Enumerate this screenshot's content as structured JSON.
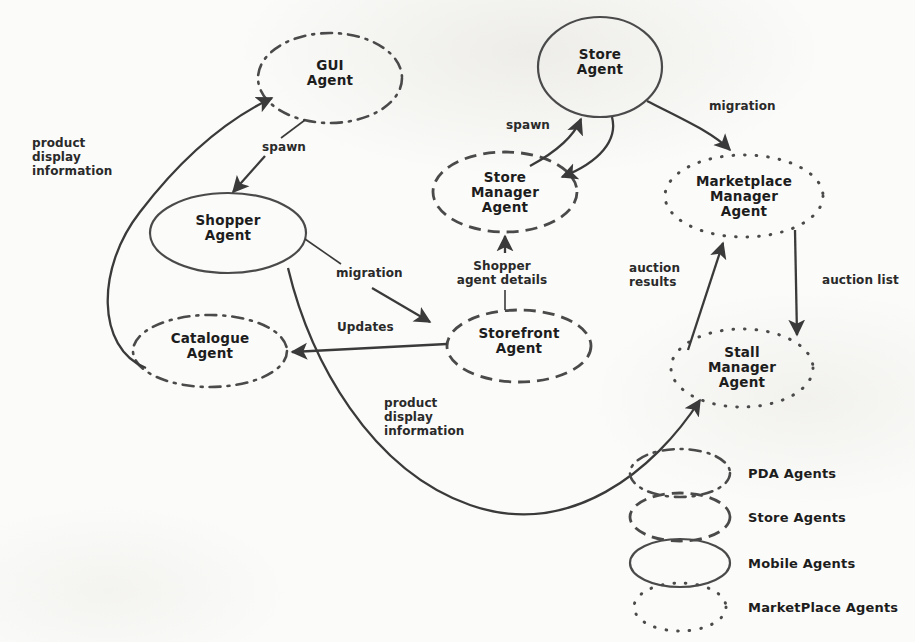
{
  "diagram": {
    "stroke_color": "#3a3a3a",
    "text_color": "#1d1d1d",
    "background_color": "#fbfbf9"
  },
  "nodes": [
    {
      "id": "gui-agent",
      "label": "GUI\nAgent",
      "style": "pda",
      "cx": 330,
      "cy": 78,
      "rx": 72,
      "ry": 45
    },
    {
      "id": "store-agent",
      "label": "Store\nAgent",
      "style": "mobile",
      "cx": 600,
      "cy": 67,
      "rx": 62,
      "ry": 50
    },
    {
      "id": "store-manager-agent",
      "label": "Store\nManager\nAgent",
      "style": "store",
      "cx": 505,
      "cy": 192,
      "rx": 72,
      "ry": 40
    },
    {
      "id": "marketplace-manager-agent",
      "label": "Marketplace\nManager\nAgent",
      "style": "marketplace",
      "cx": 744,
      "cy": 196,
      "rx": 79,
      "ry": 41
    },
    {
      "id": "shopper-agent",
      "label": "Shopper\nAgent",
      "style": "mobile",
      "cx": 228,
      "cy": 233,
      "rx": 78,
      "ry": 40
    },
    {
      "id": "catalogue-agent",
      "label": "Catalogue\nAgent",
      "style": "pda",
      "cx": 210,
      "cy": 351,
      "rx": 77,
      "ry": 36
    },
    {
      "id": "storefront-agent",
      "label": "Storefront\nAgent",
      "style": "store",
      "cx": 519,
      "cy": 346,
      "rx": 72,
      "ry": 36
    },
    {
      "id": "stall-manager-agent",
      "label": "Stall\nManager\nAgent",
      "style": "marketplace",
      "cx": 742,
      "cy": 368,
      "rx": 71,
      "ry": 39
    }
  ],
  "edges": [
    {
      "id": "gui-spawns-shopper",
      "label": "spawn",
      "from": "gui-agent",
      "to": "shopper-agent",
      "lx": 262,
      "ly": 140
    },
    {
      "id": "store-spawns-store-manager",
      "label": "spawn",
      "from": "store-agent",
      "to": "store-manager-agent",
      "lx": 506,
      "ly": 118
    },
    {
      "id": "store-migration-marketplace",
      "label": "migration",
      "from": "store-agent",
      "to": "marketplace-manager-agent",
      "lx": 709,
      "ly": 99
    },
    {
      "id": "shopper-migration-storefront",
      "label": "migration",
      "from": "shopper-agent",
      "to": "storefront-agent",
      "lx": 336,
      "ly": 266
    },
    {
      "id": "storefront-shopper-agent-details",
      "label": "Shopper\nagent details",
      "from": "storefront-agent",
      "to": "store-manager-agent",
      "lx": 474,
      "ly": 259
    },
    {
      "id": "storefront-updates-catalogue",
      "label": "Updates",
      "from": "storefront-agent",
      "to": "catalogue-agent",
      "lx": 337,
      "ly": 320
    },
    {
      "id": "catalogue-product-display-gui",
      "label": "product\ndisplay\ninformation",
      "from": "catalogue-agent",
      "to": "gui-agent",
      "lx": 32,
      "ly": 136
    },
    {
      "id": "shopper-product-display-stall",
      "label": "product\ndisplay\ninformation",
      "from": "shopper-agent",
      "to": "stall-manager-agent",
      "lx": 384,
      "ly": 396
    },
    {
      "id": "stall-auction-results-marketplace",
      "label": "auction\nresults",
      "from": "stall-manager-agent",
      "to": "marketplace-manager-agent",
      "lx": 629,
      "ly": 261
    },
    {
      "id": "marketplace-auction-list-stall",
      "label": "auction list",
      "from": "marketplace-manager-agent",
      "to": "stall-manager-agent",
      "lx": 822,
      "ly": 273
    }
  ],
  "legend": {
    "items": [
      {
        "id": "legend-pda",
        "label": "PDA Agents",
        "style": "pda",
        "cx": 680,
        "cy": 473,
        "rx": 50,
        "ry": 24
      },
      {
        "id": "legend-store",
        "label": "Store Agents",
        "style": "store",
        "cx": 680,
        "cy": 517,
        "rx": 50,
        "ry": 24
      },
      {
        "id": "legend-mobile",
        "label": "Mobile Agents",
        "style": "mobile",
        "cx": 680,
        "cy": 563,
        "rx": 50,
        "ry": 24
      },
      {
        "id": "legend-marketplace",
        "label": "MarketPlace Agents",
        "style": "marketplace",
        "cx": 680,
        "cy": 607,
        "rx": 46,
        "ry": 24
      }
    ],
    "label_x": 748
  }
}
